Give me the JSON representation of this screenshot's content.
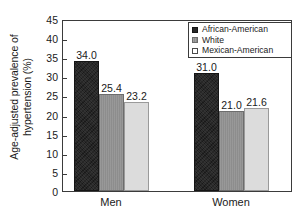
{
  "chart_data": {
    "type": "bar",
    "title": "",
    "xlabel": "",
    "ylabel": "Age-adjusted prevalence of hypertension (%)",
    "ylabel_line1": "Age-adjusted prevalence of",
    "ylabel_line2": "hypertension (%)",
    "categories": [
      "Men",
      "Women"
    ],
    "series": [
      {
        "name": "African-American",
        "values": [
          34.0,
          31.0
        ],
        "labels": [
          "34.0",
          "31.0"
        ],
        "color": "#272727",
        "swatch": "black"
      },
      {
        "name": "White",
        "values": [
          25.4,
          21.0
        ],
        "labels": [
          "25.4",
          "21.0"
        ],
        "color": "#8d8d8d",
        "swatch": "mid"
      },
      {
        "name": "Mexican-American",
        "values": [
          23.2,
          21.6
        ],
        "labels": [
          "23.2",
          "21.6"
        ],
        "color": "#dcdcdc",
        "swatch": "light"
      }
    ],
    "ylim": [
      0,
      45
    ],
    "ytick_values": [
      0,
      5,
      10,
      15,
      20,
      25,
      30,
      35,
      40,
      45
    ],
    "ytick_labels": [
      "0",
      "5",
      "10",
      "15",
      "20",
      "25",
      "30",
      "35",
      "40",
      "45"
    ],
    "grid": false,
    "legend_position": "top-right",
    "legend_entries": [
      "African-American",
      "White",
      "Mexican-American"
    ]
  }
}
